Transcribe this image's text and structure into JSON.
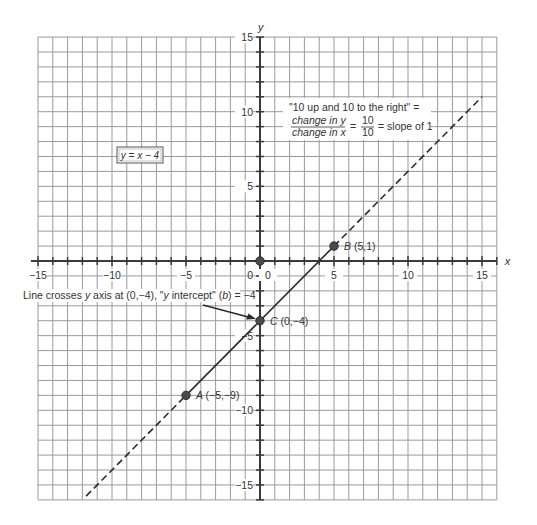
{
  "chart_data": {
    "type": "line",
    "title": "",
    "equation_label": "y = x − 4",
    "xlabel": "x",
    "ylabel": "y",
    "xlim": [
      -15,
      16
    ],
    "ylim": [
      -16,
      15
    ],
    "grid": true,
    "grid_step": 1,
    "x_tick_labels": [
      {
        "value": -15,
        "label": "−15"
      },
      {
        "value": -10,
        "label": "−10"
      },
      {
        "value": -5,
        "label": "−5"
      },
      {
        "value": 0,
        "label": "0"
      },
      {
        "value": 5,
        "label": "5"
      },
      {
        "value": 10,
        "label": "10"
      },
      {
        "value": 15,
        "label": "15"
      }
    ],
    "y_tick_labels": [
      {
        "value": 15,
        "label": "15"
      },
      {
        "value": 10,
        "label": "10"
      },
      {
        "value": 5,
        "label": "5"
      },
      {
        "value": 0,
        "label": "0"
      },
      {
        "value": -5,
        "label": "−5"
      },
      {
        "value": -10,
        "label": "−10"
      },
      {
        "value": -15,
        "label": "−15"
      }
    ],
    "series": [
      {
        "name": "y = x − 4",
        "slope": 1,
        "intercept": -4,
        "solid_segment": {
          "x": [
            -5,
            5
          ],
          "y": [
            -9,
            1
          ]
        },
        "dashed_extensions": [
          {
            "x": [
              -11.75,
              -5
            ],
            "y": [
              -15.75,
              -9
            ]
          },
          {
            "x": [
              5,
              15
            ],
            "y": [
              1,
              11
            ]
          }
        ]
      }
    ],
    "points": [
      {
        "name": "A",
        "x": -5,
        "y": -9,
        "label": "(−5,−9)"
      },
      {
        "name": "B",
        "x": 5,
        "y": 1,
        "label": "(5,1)"
      },
      {
        "name": "C",
        "x": 0,
        "y": -4,
        "label": "(0,−4)"
      },
      {
        "name": "origin",
        "x": 0,
        "y": 0,
        "label": ""
      }
    ],
    "annotations": {
      "slope_line1": "\"10 up and 10 to the right\" =",
      "slope_numerator": "change in y",
      "slope_denominator": "change in x",
      "slope_equals": "=",
      "slope_frac_num": "10",
      "slope_frac_den": "10",
      "slope_result": "= slope of 1",
      "intercept_note_pre": "Line crosses ",
      "intercept_note_y": "y",
      "intercept_note_mid": " axis at (0,−4), \"",
      "intercept_note_y2": "y",
      "intercept_note_mid2": " intercept\" (",
      "intercept_note_b": "b",
      "intercept_note_post": ") = −4"
    }
  },
  "colors": {
    "grid": "#9a9a9a",
    "axis": "#3a3a3a",
    "line": "#2c2c2c",
    "point": "#4a4a4a"
  }
}
